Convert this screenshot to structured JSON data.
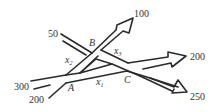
{
  "diagram": {
    "type": "traffic-flow-network",
    "nodes": [
      {
        "id": "A",
        "label": "A"
      },
      {
        "id": "B",
        "label": "B"
      },
      {
        "id": "C",
        "label": "C"
      }
    ],
    "edges": [
      {
        "from": "A",
        "to": "B",
        "label_var": "x",
        "label_sub": "2"
      },
      {
        "from": "A",
        "to": "C",
        "label_var": "x",
        "label_sub": "1"
      },
      {
        "from": "B",
        "to": "C",
        "label_var": "x",
        "label_sub": "3"
      }
    ],
    "external_flows": [
      {
        "value": "300",
        "direction": "in",
        "node": "A"
      },
      {
        "value": "200",
        "direction": "in",
        "node": "A"
      },
      {
        "value": "50",
        "direction": "in",
        "node": "B"
      },
      {
        "value": "100",
        "direction": "out",
        "node": "B"
      },
      {
        "value": "200",
        "direction": "out",
        "node": "C"
      },
      {
        "value": "250",
        "direction": "out",
        "node": "C"
      }
    ]
  }
}
